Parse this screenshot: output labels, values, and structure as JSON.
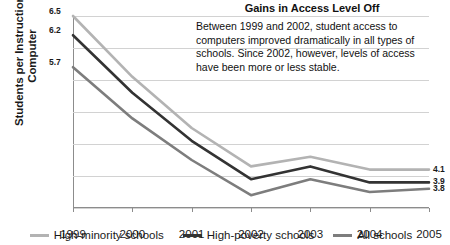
{
  "chart_data": {
    "type": "line",
    "title": "Gains in Access Level Off",
    "xlabel": "",
    "ylabel": "Students per Instructional Computer",
    "ylabel_lines": [
      "Students per Instructional",
      "Computer"
    ],
    "categories": [
      "1999",
      "2000",
      "2001",
      "2002",
      "2003",
      "2004",
      "2005"
    ],
    "x": [
      1999,
      2000,
      2001,
      2002,
      2003,
      2004,
      2005
    ],
    "ylim": [
      3.5,
      6.5
    ],
    "yticks": [
      "3.5",
      "4.0",
      "4.5",
      "5.0",
      "5.5",
      "6.0",
      "6.5"
    ],
    "ytick_values": [
      3.5,
      4.0,
      4.5,
      5.0,
      5.5,
      6.0,
      6.5
    ],
    "grid": true,
    "legend_position": "bottom",
    "series": [
      {
        "name": "High-minority schools",
        "color": "#b3b3b3",
        "values": [
          6.5,
          5.55,
          4.75,
          4.15,
          4.3,
          4.1,
          4.1
        ],
        "start_label": "6.5",
        "end_label": "4.1"
      },
      {
        "name": "High-poverty schools",
        "color": "#333333",
        "values": [
          6.2,
          5.3,
          4.55,
          3.95,
          4.15,
          3.9,
          3.9
        ],
        "start_label": "6.2",
        "end_label": "3.9"
      },
      {
        "name": "All schools",
        "color": "#7d7d7d",
        "values": [
          5.7,
          4.9,
          4.25,
          3.7,
          3.95,
          3.75,
          3.8
        ],
        "start_label": "5.7",
        "end_label": "3.8"
      }
    ],
    "annotation": "Between 1999 and 2002, student access to computers improved dramatically in all types of schools. Since 2002, however, levels of access have been more or less stable."
  }
}
